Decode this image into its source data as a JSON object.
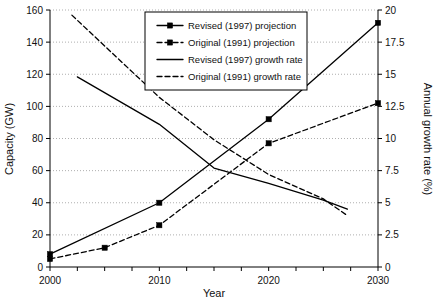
{
  "chart_data": {
    "type": "line",
    "title": "",
    "xlabel": "Year",
    "ylabel": "Capacity (GW)",
    "y2label": "Annual growth rate (%)",
    "xlim": [
      2000,
      2030
    ],
    "ylim": [
      0,
      160
    ],
    "y2lim": [
      0,
      20
    ],
    "grid": true,
    "legend_position": "top-center",
    "x_ticks": [
      2000,
      2010,
      2020,
      2030
    ],
    "x_tick_labels": [
      "2000",
      "2010",
      "2020",
      "2030"
    ],
    "x_minor_step": 2.5,
    "y_ticks": [
      0,
      20,
      40,
      60,
      80,
      100,
      120,
      140,
      160
    ],
    "y_tick_labels": [
      "0",
      "20",
      "40",
      "60",
      "80",
      "100",
      "120",
      "140",
      "160"
    ],
    "y2_ticks": [
      0,
      2.5,
      5,
      7.5,
      10,
      12.5,
      15,
      17.5,
      20
    ],
    "y2_tick_labels": [
      "0",
      "2.5",
      "5",
      "7.5",
      "10",
      "12.5",
      "15",
      "17.5",
      "20"
    ],
    "series": [
      {
        "name": "Revised (1997) projection",
        "axis": "left",
        "style": "solid",
        "marker": "square",
        "x": [
          2000,
          2010,
          2020,
          2030
        ],
        "values": [
          8,
          40,
          92,
          152
        ]
      },
      {
        "name": "Original (1991) projection",
        "axis": "left",
        "style": "dashed",
        "marker": "square",
        "x": [
          2000,
          2005,
          2010,
          2020,
          2030
        ],
        "values": [
          5,
          12,
          26,
          77,
          102
        ]
      },
      {
        "name": "Revised (1997) growth rate",
        "axis": "right",
        "style": "solid",
        "marker": "none",
        "x": [
          2002.5,
          2010,
          2015,
          2020,
          2025,
          2027.2
        ],
        "values": [
          14.8,
          11.1,
          7.7,
          6.5,
          5.2,
          4.5
        ]
      },
      {
        "name": "Original (1991) growth rate",
        "axis": "right",
        "style": "dashed",
        "marker": "none",
        "x": [
          2002,
          2010,
          2015,
          2020,
          2025,
          2027.2
        ],
        "values": [
          19.6,
          13.2,
          9.9,
          7.2,
          5.3,
          4.0
        ]
      }
    ],
    "legend_entries": [
      {
        "label": "Revised (1997) projection",
        "style": "solid",
        "marker": "square"
      },
      {
        "label": "Original (1991) projection",
        "style": "dashed",
        "marker": "square"
      },
      {
        "label": "Revised (1997) growth rate",
        "style": "solid",
        "marker": "none"
      },
      {
        "label": "Original (1991) growth rate",
        "style": "dashed",
        "marker": "none"
      }
    ],
    "colors": {
      "line": "#000000",
      "grid": "#9a9a9a",
      "axis": "#000000",
      "background": "#ffffff"
    }
  }
}
